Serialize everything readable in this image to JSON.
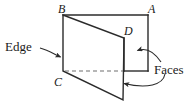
{
  "figure": {
    "type": "geometry-diagram",
    "width": 194,
    "height": 107,
    "background_color": "#ffffff",
    "stroke_color": "#2b2b2b",
    "dashed_stroke_color": "#6e6e6e",
    "vertex_labels": [
      {
        "id": "B",
        "text": "B",
        "x": 58,
        "y": 3
      },
      {
        "id": "A",
        "text": "A",
        "x": 148,
        "y": 3
      },
      {
        "id": "D",
        "text": "D",
        "x": 124,
        "y": 25
      },
      {
        "id": "C",
        "text": "C",
        "x": 54,
        "y": 76
      }
    ],
    "callouts": [
      {
        "id": "edge",
        "text": "Edge",
        "x": 5,
        "y": 40
      },
      {
        "id": "faces",
        "text": "Faces",
        "x": 154,
        "y": 63
      }
    ],
    "geometry": {
      "back_rectangle": {
        "points": "63,15 148,15 148,71 124,71 124,38 63,15",
        "top_edge": [
          [
            63,
            15
          ],
          [
            148,
            15
          ]
        ],
        "right_edge": [
          [
            148,
            15
          ],
          [
            148,
            71
          ]
        ],
        "bottom_edge": [
          [
            148,
            71
          ],
          [
            124,
            71
          ]
        ],
        "inner_vertical_edge": [
          [
            124,
            38
          ],
          [
            124,
            71
          ]
        ]
      },
      "front_face": {
        "label": "parallelogram B-D-bottom-C",
        "points": "63,15 124,38 123,100 63,71"
      },
      "hidden_edge_dashed": [
        [
          64,
          71
        ],
        [
          123,
          71
        ]
      ],
      "edge_segment": [
        [
          63,
          15
        ],
        [
          63,
          71
        ]
      ]
    },
    "arrows": [
      {
        "id": "edge-arrow",
        "from": [
          40,
          48
        ],
        "to": [
          62,
          58
        ],
        "path": "M40,48 C48,50 54,54 61,57"
      },
      {
        "id": "faces-arrow-upper",
        "from": [
          160,
          62
        ],
        "to": [
          135,
          51
        ],
        "path": "M160,62 C154,53 146,48 136,50"
      },
      {
        "id": "faces-arrow-lower",
        "from": [
          164,
          74
        ],
        "to": [
          120,
          83
        ],
        "path": "M164,74 C162,84 146,88 122,83"
      }
    ]
  }
}
